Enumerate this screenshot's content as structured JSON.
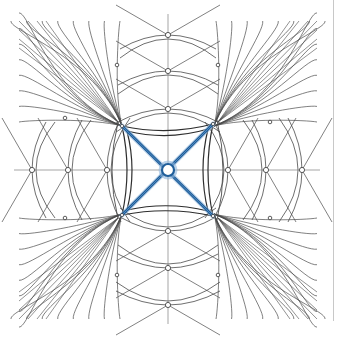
{
  "diagram": {
    "kind": "vault-rib-plan",
    "colors": {
      "background": "#ffffff",
      "line": "#4a4a4a",
      "axis": "#6a6a6a",
      "rib_highlight": "#1f5e9a",
      "rib_glow": "#8fb6dc",
      "divider": "#c8c8c8"
    },
    "frame": {
      "left": 18,
      "top": 20,
      "right": 316,
      "bottom": 318
    },
    "center": {
      "x": 168,
      "y": 170
    },
    "central_bay": {
      "corners": [
        [
          122,
          126
        ],
        [
          213,
          124
        ],
        [
          213,
          216
        ],
        [
          122,
          215
        ]
      ],
      "bow": 10
    },
    "bosses": {
      "center": {
        "x": 168,
        "y": 170,
        "r": 6
      },
      "axis_top": [
        [
          168,
          35
        ],
        [
          168,
          71
        ],
        [
          168,
          109
        ]
      ],
      "axis_bottom": [
        [
          168,
          231
        ],
        [
          168,
          268
        ],
        [
          168,
          305
        ]
      ],
      "axis_left": [
        [
          32,
          170
        ],
        [
          68,
          170
        ],
        [
          107,
          170
        ]
      ],
      "axis_right": [
        [
          228,
          170
        ],
        [
          266,
          170
        ],
        [
          302,
          170
        ]
      ],
      "diagonal": [
        [
          117,
          65
        ],
        [
          218,
          65
        ],
        [
          65,
          118
        ],
        [
          270,
          122
        ],
        [
          65,
          218
        ],
        [
          270,
          218
        ],
        [
          117,
          275
        ],
        [
          218,
          275
        ]
      ]
    }
  }
}
